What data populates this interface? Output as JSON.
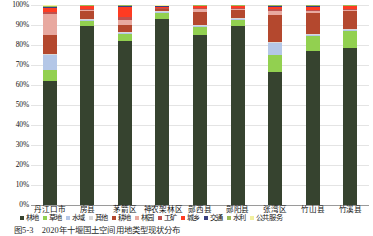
{
  "chart_data": {
    "type": "bar",
    "subtype": "stacked-percent",
    "title": "",
    "xlabel": "",
    "ylabel": "",
    "ylim": [
      0,
      100
    ],
    "ytick_labels": [
      "0%",
      "10%",
      "20%",
      "30%",
      "40%",
      "50%",
      "60%",
      "70%",
      "80%",
      "90%",
      "100%"
    ],
    "ytick_values": [
      0,
      10,
      20,
      30,
      40,
      50,
      60,
      70,
      80,
      90,
      100
    ],
    "grid": true,
    "legend_position": "bottom",
    "categories": [
      "丹江口市",
      "房县",
      "茅箭区",
      "神农架林区",
      "郧西县",
      "郧阳县",
      "张湾区",
      "竹山县",
      "竹溪县"
    ],
    "series": [
      {
        "name": "林地",
        "color": "#36432f",
        "values": [
          61.5,
          89.5,
          82.0,
          93.0,
          85.0,
          89.5,
          66.5,
          77.0,
          78.5
        ]
      },
      {
        "name": "草地",
        "color": "#92d050",
        "values": [
          5.5,
          2.5,
          3.5,
          3.0,
          4.0,
          3.0,
          8.5,
          7.5,
          8.5
        ]
      },
      {
        "name": "水域",
        "color": "#b4c7e7",
        "values": [
          7.5,
          0.5,
          0.5,
          0.5,
          0.5,
          0.5,
          6.0,
          0.5,
          0.5
        ]
      },
      {
        "name": "其他",
        "color": "#d9d9d9",
        "values": [
          0.5,
          0.5,
          0.5,
          0.3,
          0.5,
          0.5,
          0.5,
          0.5,
          0.5
        ]
      },
      {
        "name": "耕地",
        "color": "#b4482e",
        "values": [
          9.5,
          4.0,
          3.5,
          1.0,
          6.5,
          4.0,
          13.5,
          10.5,
          9.0
        ]
      },
      {
        "name": "林园",
        "color": "#e8a9a0",
        "values": [
          10.5,
          0.5,
          2.5,
          0.4,
          1.5,
          0.6,
          2.0,
          0.8,
          0.7
        ]
      },
      {
        "name": "工矿",
        "color": "#c0504d",
        "values": [
          1.0,
          0.4,
          1.5,
          0.3,
          0.6,
          0.4,
          0.8,
          0.5,
          0.4
        ]
      },
      {
        "name": "城乡",
        "color": "#ff3b22",
        "values": [
          2.0,
          1.5,
          5.0,
          0.6,
          0.8,
          0.9,
          1.0,
          1.9,
          1.2
        ]
      },
      {
        "name": "交通",
        "color": "#3b3f80",
        "values": [
          0.6,
          0.3,
          0.5,
          0.3,
          0.3,
          0.3,
          0.7,
          0.4,
          0.3
        ]
      },
      {
        "name": "水利",
        "color": "#9bbb59",
        "values": [
          0.5,
          0.2,
          0.3,
          0.2,
          0.2,
          0.2,
          0.3,
          0.2,
          0.2
        ]
      },
      {
        "name": "公共服务",
        "color": "#f2f0a0",
        "values": [
          0.4,
          0.1,
          0.2,
          0.4,
          0.1,
          0.1,
          0.2,
          0.2,
          0.2
        ]
      }
    ]
  },
  "caption": "图5-3　2020年十堰国土空间用地类型现状分布"
}
